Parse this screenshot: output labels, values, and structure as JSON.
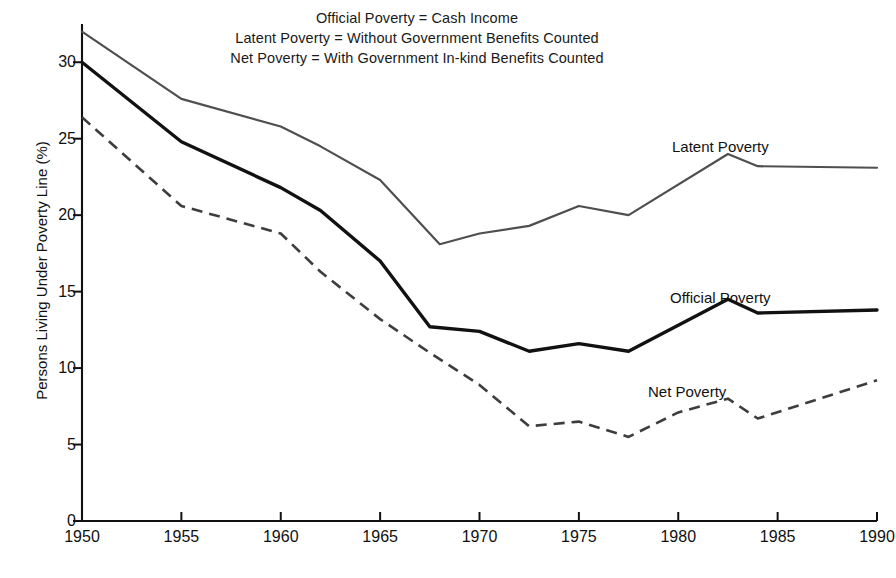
{
  "chart_data": {
    "type": "line",
    "title": "",
    "xlabel": "",
    "ylabel": "Persons Living Under Poverty Line (%)",
    "xlim": [
      1950,
      1990
    ],
    "ylim": [
      0,
      32.5
    ],
    "xticks": [
      1950,
      1955,
      1960,
      1965,
      1970,
      1975,
      1980,
      1985,
      1990
    ],
    "yticks": [
      0,
      5,
      10,
      15,
      20,
      25,
      30
    ],
    "grid": false,
    "legend_position": "inline-right",
    "annotations": [
      "Official Poverty = Cash Income",
      "Latent Poverty = Without Government Benefits Counted",
      "Net Poverty = With Government In-kind Benefits Counted"
    ],
    "series": [
      {
        "name": "Latent Poverty",
        "style": "solid-thin",
        "color": "#4f4f4f",
        "x": [
          1950,
          1955,
          1960,
          1962,
          1965,
          1968,
          1970,
          1972.5,
          1975,
          1977.5,
          1982.5,
          1984,
          1990
        ],
        "values": [
          32.0,
          27.6,
          25.8,
          24.5,
          22.3,
          18.1,
          18.8,
          19.3,
          20.6,
          20.0,
          24.0,
          23.2,
          23.1
        ]
      },
      {
        "name": "Official Poverty",
        "style": "solid-thick",
        "color": "#111111",
        "x": [
          1950,
          1955,
          1960,
          1962,
          1965,
          1967.5,
          1970,
          1972.5,
          1975,
          1977.5,
          1982.5,
          1984,
          1990
        ],
        "values": [
          30.0,
          24.8,
          21.8,
          20.3,
          17.0,
          12.7,
          12.4,
          11.1,
          11.6,
          11.1,
          14.5,
          13.6,
          13.8
        ]
      },
      {
        "name": "Net Poverty",
        "style": "dashed",
        "color": "#3d3d3d",
        "x": [
          1950,
          1955,
          1960,
          1962,
          1965,
          1967.5,
          1970,
          1972.5,
          1975,
          1977.5,
          1980,
          1982.5,
          1984,
          1990
        ],
        "values": [
          26.4,
          20.6,
          18.8,
          16.3,
          13.2,
          11.0,
          8.9,
          6.2,
          6.5,
          5.5,
          7.1,
          8.0,
          6.7,
          9.2
        ]
      }
    ]
  },
  "labels": {
    "latent": "Latent Poverty",
    "official": "Official Poverty",
    "net": "Net Poverty"
  },
  "annotation_lines": {
    "line1": "Official Poverty = Cash Income",
    "line2": "Latent Poverty = Without Government Benefits Counted",
    "line3": "Net Poverty = With Government In-kind Benefits Counted"
  },
  "axis": {
    "ylabel": "Persons Living Under Poverty Line (%)"
  }
}
